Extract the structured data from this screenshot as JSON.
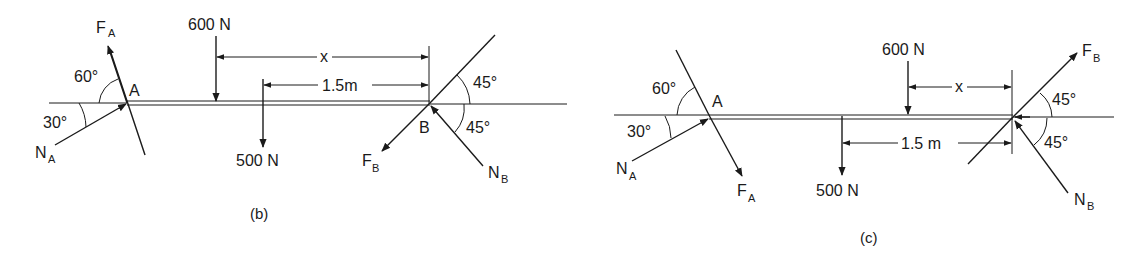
{
  "figures": [
    {
      "id": "b",
      "caption": "(b)",
      "labels": {
        "force_a": "F",
        "force_a_sub": "A",
        "normal_a": "N",
        "normal_a_sub": "A",
        "force_b": "F",
        "force_b_sub": "B",
        "normal_b": "N",
        "normal_b_sub": "B",
        "point_a": "A",
        "point_b": "B",
        "load_600": "600 N",
        "load_500": "500 N",
        "dim_x": "x",
        "dim_15": "1.5m",
        "angle_60": "60°",
        "angle_30": "30°",
        "angle_45_top": "45°",
        "angle_45_bot": "45°"
      }
    },
    {
      "id": "c",
      "caption": "(c)",
      "labels": {
        "force_a": "F",
        "force_a_sub": "A",
        "normal_a": "N",
        "normal_a_sub": "A",
        "force_b": "F",
        "force_b_sub": "B",
        "normal_b": "N",
        "normal_b_sub": "B",
        "point_a": "A",
        "load_600": "600 N",
        "load_500": "500 N",
        "dim_x": "x",
        "dim_15": "1.5 m",
        "angle_60": "60°",
        "angle_30": "30°",
        "angle_45_top": "45°",
        "angle_45_bot": "45°"
      }
    }
  ]
}
